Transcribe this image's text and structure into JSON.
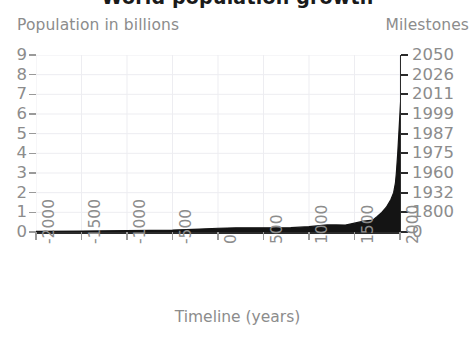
{
  "chart_data": {
    "type": "area",
    "title": "World population growth",
    "xlabel": "Timeline (years)",
    "ylabel": "Population in billions",
    "ylabel_right": "Milestones",
    "xlim": [
      -2000,
      2000
    ],
    "ylim": [
      0,
      9
    ],
    "grid": true,
    "legend": "none",
    "series_name": "World population",
    "fill_color": "#141414",
    "x_ticks": [
      "-2000",
      "-1500",
      "-1000",
      "-500",
      "0",
      "500",
      "1000",
      "1500",
      "2000"
    ],
    "x_tick_values": [
      -2000,
      -1500,
      -1000,
      -500,
      0,
      500,
      1000,
      1500,
      2000
    ],
    "y_ticks": [
      "0",
      "1",
      "2",
      "3",
      "4",
      "5",
      "6",
      "7",
      "8",
      "9"
    ],
    "y_tick_values": [
      0,
      1,
      2,
      3,
      4,
      5,
      6,
      7,
      8,
      9
    ],
    "right_axis_ticks": [
      "0",
      "1800",
      "1932",
      "1960",
      "1975",
      "1987",
      "1999",
      "2011",
      "2026",
      "2050"
    ],
    "right_axis_tick_values": [
      0,
      1,
      2,
      3,
      4,
      5,
      6,
      7,
      8,
      9
    ],
    "milestones": [
      {
        "billions": 1,
        "year": "1800"
      },
      {
        "billions": 2,
        "year": "1932"
      },
      {
        "billions": 3,
        "year": "1960"
      },
      {
        "billions": 4,
        "year": "1975"
      },
      {
        "billions": 5,
        "year": "1987"
      },
      {
        "billions": 6,
        "year": "1999"
      },
      {
        "billions": 7,
        "year": "2011"
      },
      {
        "billions": 8,
        "year": "2026"
      },
      {
        "billions": 9,
        "year": "2050"
      }
    ],
    "x": [
      -2000,
      -1500,
      -1000,
      -500,
      -200,
      0,
      200,
      400,
      600,
      800,
      1000,
      1200,
      1300,
      1400,
      1500,
      1600,
      1700,
      1750,
      1800,
      1850,
      1900,
      1930,
      1950,
      1960,
      1975,
      1987,
      1999,
      2011,
      2020,
      2026,
      2040,
      2050
    ],
    "values": [
      0.027,
      0.05,
      0.07,
      0.1,
      0.15,
      0.19,
      0.21,
      0.21,
      0.21,
      0.22,
      0.27,
      0.36,
      0.36,
      0.35,
      0.45,
      0.55,
      0.6,
      0.79,
      1.0,
      1.26,
      1.65,
      2.0,
      2.5,
      3.0,
      4.0,
      5.0,
      6.0,
      7.0,
      7.8,
      8.0,
      8.8,
      9.0
    ]
  },
  "axes": {
    "left_title": "Population in billions",
    "right_title": "Milestones",
    "bottom_title": "Timeline (years)"
  },
  "header": {
    "title": "World population growth"
  }
}
